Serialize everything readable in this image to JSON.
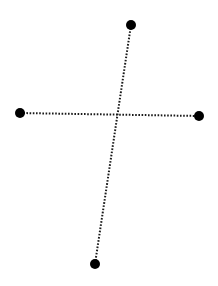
{
  "diagram": {
    "width": 218,
    "height": 286,
    "background": "#ffffff",
    "stroke_color": "#1a1a1a",
    "dot_color": "#000000",
    "dot_radius": 5,
    "points": [
      {
        "id": "top",
        "x": 131,
        "y": 25
      },
      {
        "id": "left",
        "x": 20,
        "y": 113
      },
      {
        "id": "right",
        "x": 199,
        "y": 116
      },
      {
        "id": "bottom",
        "x": 95,
        "y": 264
      }
    ],
    "segments": [
      {
        "id": "vertical",
        "from": "top",
        "to": "bottom",
        "style": "dotted"
      },
      {
        "id": "horizontal",
        "from": "left",
        "to": "right",
        "style": "dotted"
      }
    ]
  }
}
